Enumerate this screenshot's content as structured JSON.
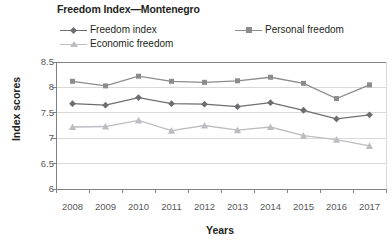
{
  "chart_data": {
    "type": "line",
    "title": "Freedom Index—Montenegro",
    "xlabel": "Years",
    "ylabel": "Index scores",
    "categories": [
      "2008",
      "2009",
      "2010",
      "2011",
      "2012",
      "2013",
      "2014",
      "2015",
      "2016",
      "2017"
    ],
    "ylim": [
      6,
      8.5
    ],
    "yticks": [
      "6",
      "6.5",
      "7",
      "7.5",
      "8",
      "8.5"
    ],
    "ytick_values": [
      6,
      6.5,
      7,
      7.5,
      8,
      8.5
    ],
    "grid": true,
    "legend_position": "top",
    "series": [
      {
        "name": "Freedom index",
        "marker": "diamond",
        "color": "#6d6e71",
        "values": [
          7.68,
          7.65,
          7.8,
          7.68,
          7.67,
          7.62,
          7.7,
          7.55,
          7.38,
          7.46
        ]
      },
      {
        "name": "Personal freedom",
        "marker": "square",
        "color": "#8c8c8e",
        "values": [
          8.12,
          8.03,
          8.22,
          8.12,
          8.1,
          8.13,
          8.2,
          8.08,
          7.78,
          8.05
        ]
      },
      {
        "name": "Economic freedom",
        "marker": "triangle",
        "color": "#bcbdc0",
        "values": [
          7.22,
          7.23,
          7.35,
          7.15,
          7.25,
          7.16,
          7.22,
          7.05,
          6.97,
          6.85
        ]
      }
    ]
  },
  "axes": {
    "y_title": "Index scores",
    "x_title": "Years"
  },
  "colors": {
    "series_freedom_index": "#6d6e71",
    "series_personal_freedom": "#8c8c8e",
    "series_economic_freedom": "#bcbdc0",
    "grid": "#d9d9d9",
    "axis": "#808285",
    "text": "#231f20"
  }
}
